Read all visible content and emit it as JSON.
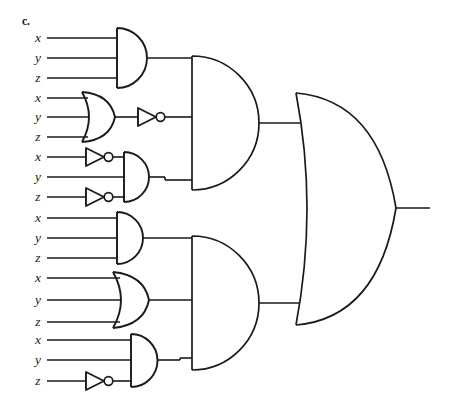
{
  "figure": {
    "part_label": "c.",
    "output_label": "",
    "ink_color": "#1a1a1a",
    "background_color": "#ffffff"
  },
  "inputs": [
    {
      "id": "g1-x",
      "label": "x",
      "x": 36,
      "y": 38,
      "line_x2": 117,
      "inverted": false
    },
    {
      "id": "g1-y",
      "label": "y",
      "x": 36,
      "y": 58,
      "line_x2": 117,
      "inverted": false
    },
    {
      "id": "g1-z",
      "label": "z",
      "x": 36,
      "y": 78,
      "line_x2": 117,
      "inverted": false
    },
    {
      "id": "g2-x",
      "label": "x",
      "x": 36,
      "y": 98,
      "line_x2": 82,
      "inverted": false
    },
    {
      "id": "g2-y",
      "label": "y",
      "x": 36,
      "y": 117,
      "line_x2": 82,
      "inverted": false
    },
    {
      "id": "g2-z",
      "label": "z",
      "x": 36,
      "y": 137,
      "line_x2": 82,
      "inverted": false
    },
    {
      "id": "g3-x",
      "label": "x",
      "x": 36,
      "y": 157,
      "line_x2": 85,
      "inverted": true
    },
    {
      "id": "g3-y",
      "label": "y",
      "x": 36,
      "y": 177,
      "line_x2": 124,
      "inverted": false
    },
    {
      "id": "g3-z",
      "label": "z",
      "x": 36,
      "y": 197,
      "line_x2": 85,
      "inverted": true
    },
    {
      "id": "g4-x",
      "label": "x",
      "x": 36,
      "y": 218,
      "line_x2": 117,
      "inverted": false
    },
    {
      "id": "g4-y",
      "label": "y",
      "x": 36,
      "y": 238,
      "line_x2": 117,
      "inverted": false
    },
    {
      "id": "g4-z",
      "label": "z",
      "x": 36,
      "y": 258,
      "line_x2": 117,
      "inverted": false
    },
    {
      "id": "g5-x",
      "label": "x",
      "x": 36,
      "y": 278,
      "line_x2": 114,
      "inverted": false
    },
    {
      "id": "g5-y",
      "label": "y",
      "x": 36,
      "y": 300,
      "line_x2": 114,
      "inverted": false
    },
    {
      "id": "g5-z",
      "label": "z",
      "x": 36,
      "y": 322,
      "line_x2": 114,
      "inverted": false
    },
    {
      "id": "g6-x",
      "label": "x",
      "x": 36,
      "y": 340,
      "line_x2": 130,
      "inverted": false
    },
    {
      "id": "g6-y",
      "label": "y",
      "x": 36,
      "y": 360,
      "line_x2": 130,
      "inverted": false
    },
    {
      "id": "g6-z",
      "label": "z",
      "x": 36,
      "y": 381,
      "line_x2": 85,
      "inverted": true
    }
  ],
  "gates": [
    {
      "id": "gate-1",
      "type": "AND",
      "stage": 1,
      "inputs": [
        "x",
        "y",
        "z"
      ],
      "output_y": 58
    },
    {
      "id": "gate-2",
      "type": "OR",
      "stage": 1,
      "inputs": [
        "x",
        "y",
        "z"
      ],
      "output_y": 117
    },
    {
      "id": "not-2",
      "type": "NOT",
      "stage": 1,
      "inputs": [
        "or-2"
      ],
      "output_y": 117
    },
    {
      "id": "not-3x",
      "type": "NOT",
      "stage": 1,
      "inputs": [
        "x"
      ],
      "output_y": 157
    },
    {
      "id": "not-3z",
      "type": "NOT",
      "stage": 1,
      "inputs": [
        "z"
      ],
      "output_y": 197
    },
    {
      "id": "gate-3",
      "type": "AND",
      "stage": 1,
      "inputs": [
        "~x",
        "y",
        "~z"
      ],
      "output_y": 180
    },
    {
      "id": "gate-4",
      "type": "AND",
      "stage": 1,
      "inputs": [
        "x",
        "y",
        "z"
      ],
      "output_y": 238
    },
    {
      "id": "gate-5",
      "type": "OR",
      "stage": 1,
      "inputs": [
        "x",
        "y",
        "z"
      ],
      "output_y": 300
    },
    {
      "id": "not-6z",
      "type": "NOT",
      "stage": 1,
      "inputs": [
        "z"
      ],
      "output_y": 381
    },
    {
      "id": "gate-6",
      "type": "AND",
      "stage": 1,
      "inputs": [
        "x",
        "y",
        "~z"
      ],
      "output_y": 358
    },
    {
      "id": "gate-A",
      "type": "AND",
      "stage": 2,
      "inputs": [
        "gate-1",
        "not-2",
        "gate-3"
      ],
      "output_y": 124
    },
    {
      "id": "gate-B",
      "type": "AND",
      "stage": 2,
      "inputs": [
        "gate-4",
        "gate-5",
        "gate-6"
      ],
      "output_y": 298
    },
    {
      "id": "gate-OUT",
      "type": "OR",
      "stage": 3,
      "inputs": [
        "gate-A",
        "gate-B"
      ],
      "output_y": 208
    }
  ],
  "output": {
    "id": "circuit-output",
    "y": 208,
    "x_start": 395,
    "x_end": 430
  }
}
